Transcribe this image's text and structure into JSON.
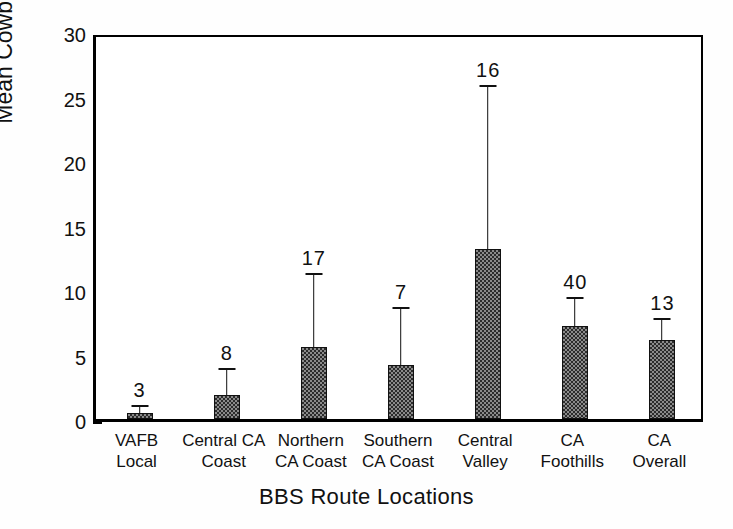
{
  "chart_data": {
    "type": "bar",
    "title": "",
    "xlabel": "BBS Route Locations",
    "ylabel": "Mean Cowbirds/Route",
    "ylim": [
      0,
      30
    ],
    "yticks": [
      0,
      5,
      10,
      15,
      20,
      25,
      30
    ],
    "ytick_labels": [
      "0",
      "5",
      "10",
      "15",
      "20",
      "25",
      "30"
    ],
    "grid": false,
    "legend": null,
    "categories": [
      "VAFB Local",
      "Central CA Coast",
      "Northern CA Coast",
      "Southern CA Coast",
      "Central Valley",
      "CA Foothills",
      "CA Overall"
    ],
    "category_lines": [
      [
        "VAFB",
        "Local"
      ],
      [
        "Central CA",
        "Coast"
      ],
      [
        "Northern",
        "CA Coast"
      ],
      [
        "Southern",
        "CA Coast"
      ],
      [
        "Central",
        "Valley"
      ],
      [
        "CA",
        "Foothills"
      ],
      [
        "CA",
        "Overall"
      ]
    ],
    "values": [
      0.5,
      1.9,
      5.6,
      4.2,
      13.2,
      7.2,
      6.1
    ],
    "error_upper": [
      0.9,
      3.8,
      11.2,
      8.5,
      25.7,
      9.3,
      7.7
    ],
    "annotations": [
      "3",
      "8",
      "17",
      "7",
      "16",
      "40",
      "13"
    ],
    "annotation_meaning": "sample size (n) of BBS routes above each bar",
    "error_type": "upper error bar (SD)",
    "bar_fill": "checkerboard-dither",
    "bar_color": "#555555",
    "axis_color": "#000000"
  },
  "axis": {
    "y_label": "Mean Cowbirds/Route",
    "x_label": "BBS Route Locations"
  }
}
